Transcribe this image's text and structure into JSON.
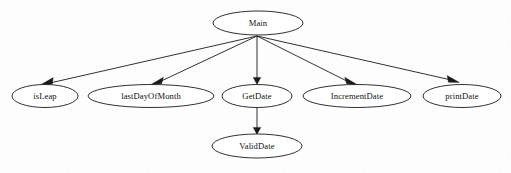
{
  "diagram": {
    "type": "call-graph",
    "canvas": {
      "width": 511,
      "height": 173
    },
    "style": {
      "background_color": "#fdfdfd",
      "node_fill": "#ffffff",
      "node_stroke": "#1a1a1a",
      "edge_color": "#1a1a1a",
      "text_color": "#111111"
    },
    "nodes": [
      {
        "id": "main",
        "label": "Main",
        "cx": 258,
        "cy": 23,
        "rx": 45,
        "ry": 12
      },
      {
        "id": "isleap",
        "label": "isLeap",
        "cx": 45,
        "cy": 96,
        "rx": 33,
        "ry": 11.5
      },
      {
        "id": "lastdayofmonth",
        "label": "lastDayOfMonth",
        "cx": 151,
        "cy": 96,
        "rx": 63,
        "ry": 11.5
      },
      {
        "id": "getdate",
        "label": "GetDate",
        "cx": 257,
        "cy": 96,
        "rx": 35,
        "ry": 11.5
      },
      {
        "id": "incrementdate",
        "label": "IncrementDate",
        "cx": 357,
        "cy": 96,
        "rx": 54,
        "ry": 11.5
      },
      {
        "id": "printdate",
        "label": "printDate",
        "cx": 462,
        "cy": 96,
        "rx": 39,
        "ry": 11.5
      },
      {
        "id": "validdate",
        "label": "ValidDate",
        "cx": 257,
        "cy": 146,
        "rx": 45,
        "ry": 12
      }
    ],
    "edges": [
      {
        "id": "main-isleap",
        "from": "main",
        "to": "isleap",
        "x1": 257,
        "y1": 36,
        "x2": 46,
        "y2": 84,
        "arrow": true
      },
      {
        "id": "main-lastdayofmonth",
        "from": "main",
        "to": "lastdayofmonth",
        "x1": 257,
        "y1": 36,
        "x2": 156,
        "y2": 84,
        "arrow": true
      },
      {
        "id": "main-getdate",
        "from": "main",
        "to": "getdate",
        "x1": 257,
        "y1": 36,
        "x2": 257,
        "y2": 84,
        "arrow": true
      },
      {
        "id": "main-incrementdate",
        "from": "main",
        "to": "incrementdate",
        "x1": 257,
        "y1": 36,
        "x2": 353,
        "y2": 84,
        "arrow": true
      },
      {
        "id": "main-printdate",
        "from": "main",
        "to": "printdate",
        "x1": 257,
        "y1": 36,
        "x2": 456,
        "y2": 83,
        "arrow": true
      },
      {
        "id": "getdate-validdate",
        "from": "getdate",
        "to": "validdate",
        "x1": 257,
        "y1": 108,
        "x2": 257,
        "y2": 134,
        "arrow": true
      }
    ]
  }
}
